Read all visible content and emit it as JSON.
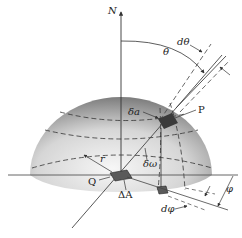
{
  "figure": {
    "type": "geometric diagram",
    "labels": {
      "north": "N",
      "theta": "θ",
      "d_theta": "dθ",
      "delta_a": "δa",
      "point_p": "P",
      "delta_omega": "δω",
      "radius": "r",
      "point_q": "Q",
      "delta_A": "ΔA",
      "phi": "φ",
      "d_phi": "dφ"
    },
    "colors": {
      "hemisphere_light": "#f2f2f2",
      "hemisphere_dark": "#8a8a8a",
      "line": "#333333",
      "patch": "#4a4a4a",
      "background": "#ffffff"
    }
  }
}
